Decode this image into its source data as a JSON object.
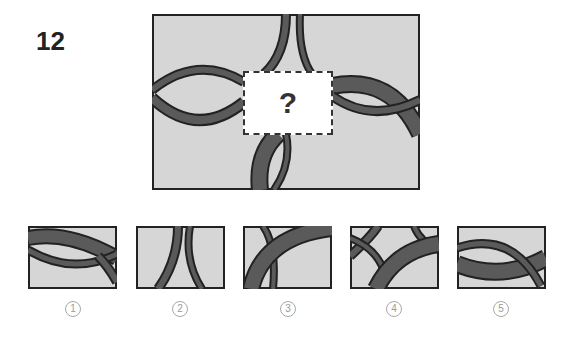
{
  "question": {
    "number": "12",
    "missing_mark": "?"
  },
  "colors": {
    "panel_bg": "#d6d6d6",
    "band_fill": "#5a5a5a",
    "outline": "#222222",
    "label_gray": "#9a9a9a"
  },
  "options": [
    {
      "label": "1"
    },
    {
      "label": "2"
    },
    {
      "label": "3"
    },
    {
      "label": "4"
    },
    {
      "label": "5"
    }
  ]
}
